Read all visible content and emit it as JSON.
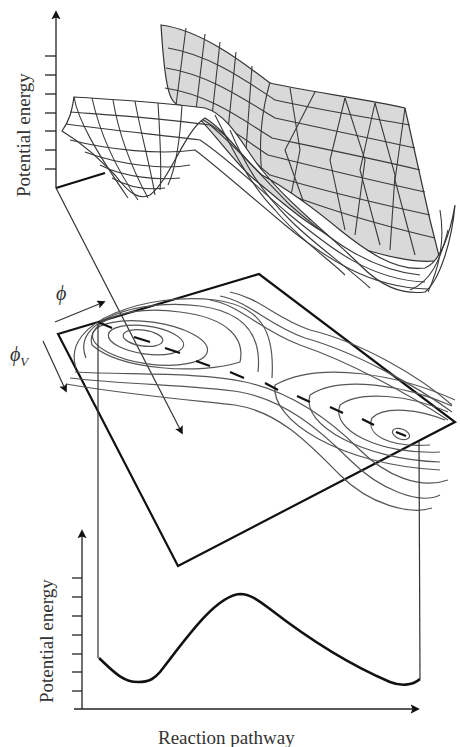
{
  "figure": {
    "top_plot": {
      "y_axis_label": "Potential energy",
      "tick_count": 7,
      "surface": "3D potential energy surface with two wells separated by a saddle"
    },
    "contour_plot": {
      "axis_label_phi": "ϕ",
      "axis_label_phi_v": "ϕ",
      "axis_label_phi_v_sub": "V",
      "minima": 2,
      "saddle_points": 1
    },
    "bottom_plot": {
      "y_axis_label": "Potential energy",
      "x_axis_label": "Reaction pathway",
      "tick_count": 7
    }
  },
  "colors": {
    "surface_back": "#d8d8d8",
    "surface_front": "#ffffff",
    "lines": "#222222"
  }
}
